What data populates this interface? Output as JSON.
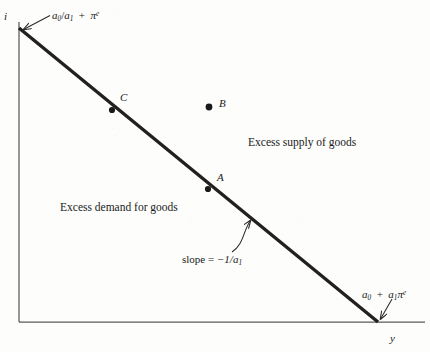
{
  "figure": {
    "kind": "economics-line-diagram",
    "background_color": "#fdfdfc",
    "ink_color": "#1a1a1a"
  },
  "axes": {
    "vertical": {
      "name": "i",
      "x_px": 19,
      "top_px": 22,
      "bottom_px": 322
    },
    "horizontal": {
      "name": "y",
      "y_px": 322,
      "left_px": 19,
      "right_px": 425
    },
    "axis_color": "#5a5a5a"
  },
  "curve": {
    "name": "goods-market-equilibrium-line",
    "start": {
      "x": 19,
      "y": 28
    },
    "end": {
      "x": 378,
      "y": 322
    },
    "thickness_px": 3.4,
    "color": "#231f20",
    "slope_label": "slope  =  −1/a₁"
  },
  "intercepts": {
    "vertical_label": "a₀/a₁  +  πᵉ",
    "vertical_label_pos": {
      "x": 52,
      "y": 13
    },
    "horizontal_label": "a₀  +  a₁πᵉ",
    "horizontal_label_pos": {
      "x": 362,
      "y": 293
    }
  },
  "points": [
    {
      "id": "C",
      "label": "C",
      "dot": {
        "x": 112,
        "y": 110
      },
      "label_pos": {
        "x": 120,
        "y": 95
      },
      "on_curve": true
    },
    {
      "id": "B",
      "label": "B",
      "dot": {
        "x": 209,
        "y": 107
      },
      "label_pos": {
        "x": 219,
        "y": 100
      },
      "on_curve": false
    },
    {
      "id": "A",
      "label": "A",
      "dot": {
        "x": 208,
        "y": 189
      },
      "label_pos": {
        "x": 217,
        "y": 175
      },
      "on_curve": true
    }
  ],
  "regions": [
    {
      "id": "excess-supply",
      "text": "Excess supply of goods",
      "pos": {
        "x": 248,
        "y": 143
      }
    },
    {
      "id": "excess-demand",
      "text": "Excess demand for goods",
      "pos": {
        "x": 60,
        "y": 208
      }
    }
  ],
  "annotations": {
    "slope": {
      "text_prefix": "slope  =  ",
      "text_value": "−1/a₁",
      "pos": {
        "x": 182,
        "y": 258
      },
      "arrow_from": {
        "x": 232,
        "y": 252
      },
      "arrow_to": {
        "x": 251,
        "y": 219
      }
    },
    "top_arrow": {
      "from": {
        "x": 50,
        "y": 16
      },
      "to": {
        "x": 22,
        "y": 30
      }
    },
    "bottom_arrow": {
      "from": {
        "x": 393,
        "y": 300
      },
      "to": {
        "x": 380,
        "y": 320
      }
    }
  }
}
